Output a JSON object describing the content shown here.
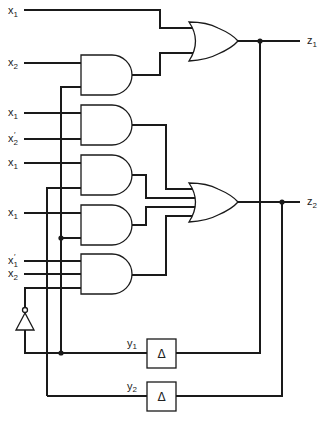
{
  "diagram": {
    "type": "sequential logic circuit (gate-level, with delay elements)",
    "inputs": [
      {
        "id": "in1",
        "base": "x",
        "sub": "1",
        "prime": false
      },
      {
        "id": "in2",
        "base": "x",
        "sub": "2",
        "prime": false
      },
      {
        "id": "in3",
        "base": "x",
        "sub": "1",
        "prime": false
      },
      {
        "id": "in4",
        "base": "x",
        "sub": "2",
        "prime": true
      },
      {
        "id": "in5",
        "base": "x",
        "sub": "1",
        "prime": false
      },
      {
        "id": "in6",
        "base": "x",
        "sub": "1",
        "prime": false
      },
      {
        "id": "in7",
        "base": "x",
        "sub": "1",
        "prime": true
      },
      {
        "id": "in8",
        "base": "x",
        "sub": "2",
        "prime": false
      }
    ],
    "outputs": [
      {
        "id": "z1",
        "base": "z",
        "sub": "1"
      },
      {
        "id": "z2",
        "base": "z",
        "sub": "2"
      }
    ],
    "state_variables": [
      {
        "id": "y1",
        "base": "y",
        "sub": "1"
      },
      {
        "id": "y2",
        "base": "y",
        "sub": "2"
      }
    ],
    "delay_symbol": "Δ",
    "prime_mark": "′",
    "gates": [
      {
        "id": "and1",
        "type": "AND",
        "inputs": [
          "x2",
          "y1"
        ]
      },
      {
        "id": "and2",
        "type": "AND",
        "inputs": [
          "x1",
          "x2'"
        ]
      },
      {
        "id": "and3",
        "type": "AND",
        "inputs": [
          "x1",
          "y2"
        ]
      },
      {
        "id": "and4",
        "type": "AND",
        "inputs": [
          "x1",
          "y1"
        ]
      },
      {
        "id": "and5",
        "type": "AND",
        "inputs": [
          "x1'",
          "x2",
          "y1'"
        ]
      },
      {
        "id": "or1",
        "type": "OR",
        "inputs": [
          "x1",
          "and1"
        ],
        "output": "z1"
      },
      {
        "id": "or2",
        "type": "OR",
        "inputs": [
          "and2",
          "and3",
          "and4",
          "and5"
        ],
        "output": "z2"
      },
      {
        "id": "inv1",
        "type": "NOT",
        "inputs": [
          "y1"
        ],
        "output": "y1'"
      },
      {
        "id": "delay1",
        "type": "DELAY",
        "inputs": [
          "z1"
        ],
        "output": "y1"
      },
      {
        "id": "delay2",
        "type": "DELAY",
        "inputs": [
          "z2"
        ],
        "output": "y2"
      }
    ]
  }
}
